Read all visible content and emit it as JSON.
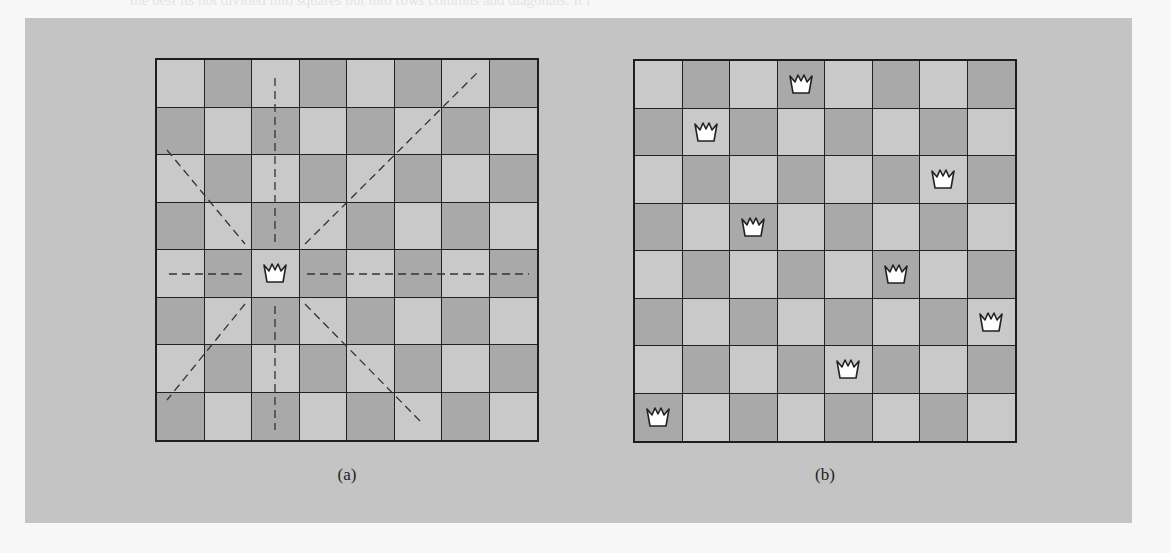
{
  "figure": {
    "background_text_lines": [
      "the best its not divided into squares but into rows columns and diagonals. It i",
      "each row, column and diagonal is safe only for the current position of the queen",
      "unoccupied row and test for those squares, or check whether a queen is in the sam",
      "there are more positions to test.",
      "need of data structures for such an algorithm. a position is a board, and instead it",
      "should represent a partial solution, one where a queen is on each row we have tried",
      "placed in the first row.",
      "Figure 8.2 shows the location of queens for a solution of the eight queens puzzle.",
      "solved by placing one queen on a row and one in each column and then proceed with th",
      "next row of the board, checking previously placed queens so that the total is only",
      "possible placement is checked by the algorithm for each row, and then simulated under",
      "checking the squares attacked by previously placed queens and then the remainder.",
      "solution is found if a queen could be placed on the last row. When a queen cannot be",
      "placed on a row the algorithm returns to the previous row and moves that queen by",
      "one square to the right. The process is repeated until a solution is found or all",
      "the possibilities have been checked. This allows the procedure to yield all the",
      "solutions of the puzzle."
    ],
    "colors": {
      "panel": "#c4c4c4",
      "light_square": "#c9c9c9",
      "dark_square": "#a9a9a9",
      "grid_line": "#222222",
      "queen_fill": "#ffffff",
      "queen_stroke": "#222222",
      "attack_line": "#333333"
    },
    "boards": [
      {
        "id": "a",
        "caption": "(a)",
        "size": 8,
        "queens": [
          [
            4,
            2
          ]
        ],
        "attack_lines": "dashed rook and bishop lines radiating from the queen at row 4, col 2"
      },
      {
        "id": "b",
        "caption": "(b)",
        "size": 8,
        "queens": [
          [
            0,
            3
          ],
          [
            1,
            1
          ],
          [
            2,
            6
          ],
          [
            3,
            2
          ],
          [
            4,
            5
          ],
          [
            5,
            7
          ],
          [
            6,
            4
          ],
          [
            7,
            0
          ]
        ],
        "attack_lines": "none"
      }
    ]
  }
}
